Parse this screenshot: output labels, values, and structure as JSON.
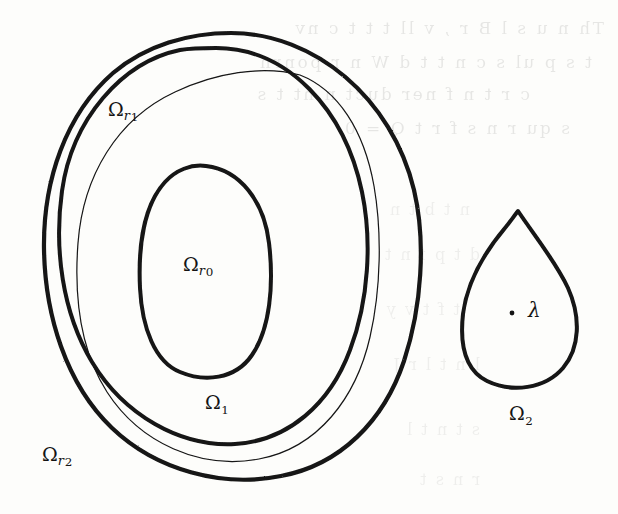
{
  "figure": {
    "caption_present": false,
    "background_color": "#fdfdfb",
    "ink_color": "#141414",
    "width": 618,
    "height": 514
  },
  "labels": {
    "omega_r1": {
      "base": "Ω",
      "sub": "r",
      "sub_digit": "1",
      "x": 108,
      "y": 100
    },
    "omega_r0": {
      "base": "Ω",
      "sub": "r",
      "sub_digit": "0",
      "x": 183,
      "y": 255
    },
    "omega_1": {
      "base": "Ω",
      "sub": "",
      "sub_digit": "1",
      "x": 205,
      "y": 393
    },
    "omega_r2": {
      "base": "Ω",
      "sub": "r",
      "sub_digit": "2",
      "x": 42,
      "y": 445
    },
    "omega_2": {
      "base": "Ω",
      "sub": "",
      "sub_digit": "2",
      "x": 509,
      "y": 404
    },
    "lambda": {
      "base": "λ",
      "x": 528,
      "y": 300
    }
  },
  "marked_point": {
    "name": "lambda-point",
    "x": 512,
    "y": 313,
    "radius": 2.4
  },
  "shapes": {
    "omega_r2_outer_oval": {
      "role": "outer thick oval boundary",
      "stroke_width": 4.2,
      "bbox": [
        43,
        33,
        418,
        478
      ]
    },
    "omega_r1_middle_oval": {
      "role": "middle thick oval boundary",
      "stroke_width": 4.0,
      "bbox": [
        58,
        48,
        365,
        445
      ]
    },
    "omega_1_thin_curve": {
      "role": "thin curve delimiting Omega_1",
      "stroke_width": 1.2,
      "bbox": [
        74,
        72,
        381,
        462
      ]
    },
    "omega_r0_inner_oval": {
      "role": "inner thick oval boundary",
      "stroke_width": 4.0,
      "bbox": [
        140,
        165,
        270,
        375
      ]
    },
    "omega_2_teardrop": {
      "role": "teardrop region with cusp at top",
      "stroke_width": 4.0,
      "apex": [
        518,
        211
      ],
      "bbox": [
        462,
        211,
        578,
        386
      ]
    }
  },
  "bleed_through_text": {
    "note": "faint mirrored show-through from the reverse page side",
    "lines": [
      {
        "text": "Th  n  u  s  l  B   r   ,  v  ll  t   t  t   c  nv",
        "x": 14,
        "y": 18,
        "width": 590
      },
      {
        "text": "t   s  p ul  s   c  n  t   t   d   W  n  r   ponrn",
        "x": 12,
        "y": 52,
        "width": 580
      },
      {
        "text": "c     r  t  n  f  ner     duct  n   nt  t   s",
        "x": 60,
        "y": 84,
        "width": 470
      },
      {
        "text": "s  qu     r   n   s    f r   t  Q  =  0",
        "x": 30,
        "y": 118,
        "width": 540
      },
      {
        "text": "n    t    b      t       n",
        "x": 150,
        "y": 200,
        "width": 320
      },
      {
        "text": "d   t    p       f   n   t",
        "x": 120,
        "y": 245,
        "width": 360
      },
      {
        "text": "t   f       t  v     y",
        "x": 160,
        "y": 300,
        "width": 300
      },
      {
        "text": "l   n   t    l  r   J",
        "x": 180,
        "y": 355,
        "width": 300
      },
      {
        "text": "s  t     n   t   l",
        "x": 200,
        "y": 420,
        "width": 280
      },
      {
        "text": "r    n   s   t",
        "x": 240,
        "y": 470,
        "width": 240
      }
    ]
  }
}
